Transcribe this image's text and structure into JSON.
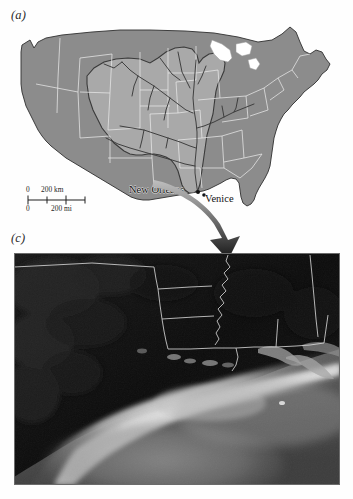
{
  "figure": {
    "panels": [
      {
        "id": "a",
        "label": "(a)",
        "type": "map",
        "description": "Grayscale map of the contiguous United States with the Mississippi River drainage basin shaded lighter and the river network drawn in dark lines"
      },
      {
        "id": "c",
        "label": "(c)",
        "type": "satellite-image",
        "description": "Grayscale satellite image of the northern Gulf of Mexico showing the Louisiana coast, the Mississippi River delta and a turbid sediment plume"
      }
    ]
  },
  "map": {
    "cities": [
      {
        "name": "New Orleans",
        "marker": "city-dot"
      },
      {
        "name": "Venice",
        "marker": "city-dot"
      }
    ],
    "scalebar": {
      "km": {
        "zero": "0",
        "value": "200 km"
      },
      "mi": {
        "zero": "0",
        "value": "200 mi"
      }
    },
    "colors": {
      "land_outside_basin": "#8c8c8c",
      "land_basin": "#a9a9a9",
      "state_border": "#e8e8e8",
      "basin_outline": "#3a3a3a",
      "river": "#3a3a3a",
      "coastline": "#2a2a2a",
      "background": "#ffffff"
    }
  },
  "satellite": {
    "colors": {
      "land": "#101010",
      "water_dark": "#2e2e2e",
      "plume_bright": "#cfcfcf",
      "border_line": "#dcdcdc",
      "frame": "#555555"
    },
    "features": [
      "Louisiana state boundary",
      "Mississippi state boundary",
      "Alabama state boundary",
      "Mississippi River delta",
      "coastal sediment plume"
    ]
  },
  "connector": {
    "kind": "curved-arrow",
    "from": "Venice",
    "to": "satellite-panel",
    "color": "#1c1c1c"
  },
  "icons": {
    "arrow": "down-arrow-icon",
    "city_dot": "map-pin-icon"
  }
}
